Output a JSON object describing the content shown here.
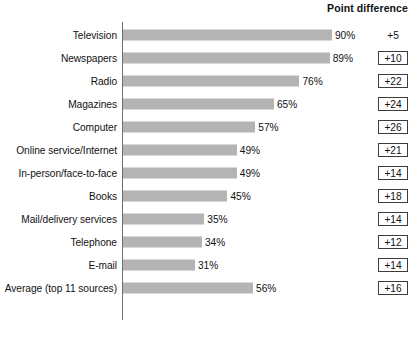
{
  "header": {
    "point_difference_label": "Point difference"
  },
  "chart_data": {
    "type": "bar",
    "orientation": "horizontal",
    "title": "",
    "subtitle": "",
    "xlabel": "",
    "ylabel": "",
    "xlim": [
      0,
      100
    ],
    "grid": false,
    "legend": "none",
    "value_suffix": "%",
    "categories": [
      "Television",
      "Newspapers",
      "Radio",
      "Magazines",
      "Computer",
      "Online service/Internet",
      "In-person/face-to-face",
      "Books",
      "Mail/delivery services",
      "Telephone",
      "E-mail",
      "Average (top 11 sources)"
    ],
    "values": [
      90,
      89,
      76,
      65,
      57,
      49,
      49,
      45,
      35,
      34,
      31,
      56
    ],
    "value_labels": [
      "90%",
      "89%",
      "76%",
      "65%",
      "57%",
      "49%",
      "49%",
      "45%",
      "35%",
      "34%",
      "31%",
      "56%"
    ],
    "point_difference": [
      "+5",
      "+10",
      "+22",
      "+24",
      "+26",
      "+21",
      "+14",
      "+18",
      "+14",
      "+12",
      "+14",
      "+16"
    ],
    "point_difference_boxed": [
      false,
      true,
      true,
      true,
      true,
      true,
      true,
      true,
      true,
      true,
      true,
      true
    ],
    "colors": {
      "bar": "#b4b4b4",
      "axis": "#6e6e6e",
      "text": "#121212",
      "box_border": "#3c3c3c",
      "background": "#ffffff"
    }
  }
}
